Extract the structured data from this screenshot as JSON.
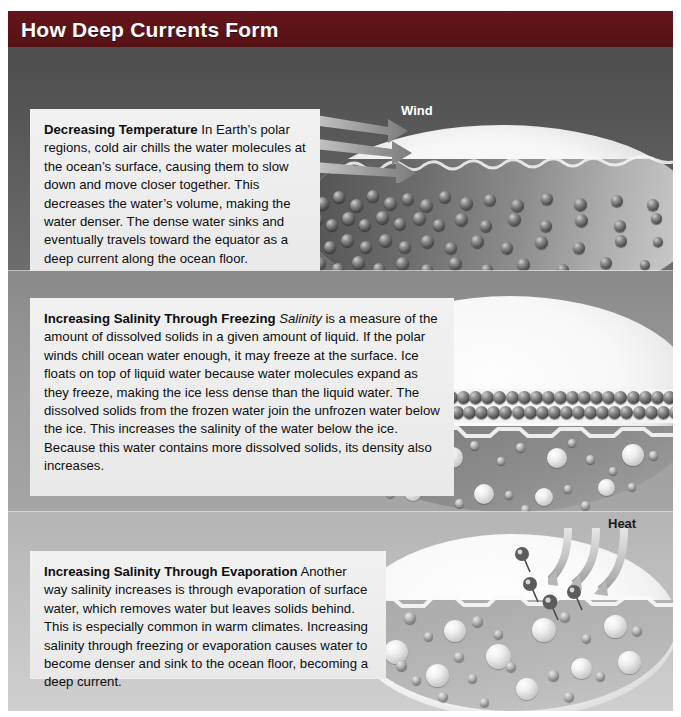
{
  "figure": {
    "title": "How Deep Currents Form",
    "title_bar_color": "#5d1418",
    "frame_background": "#b9b9b9"
  },
  "panels": [
    {
      "id": "panel-1",
      "background_color": "#5a5a5a",
      "art_label": "Wind",
      "art_label_style": "light",
      "callout": {
        "lead": "Decreasing Temperature",
        "body": " In Earth’s polar regions, cold air chills the water molecules at the ocean’s surface, causing them to slow down and move closer together. This decreases the water’s volume, making the water denser. The dense water sinks and eventually travels toward the equator as a deep current along the ocean floor."
      }
    },
    {
      "id": "panel-2",
      "background_color": "#9a9a9a",
      "art_label": "",
      "art_label_style": "light",
      "callout": {
        "lead": "Increasing Salinity Through Freezing",
        "italic_term": "Salinity",
        "body_before_italic": "  ",
        "body": " is a measure of the amount of dissolved solids in a given amount of liquid. If the polar winds chill ocean water enough, it may freeze at the surface. Ice floats on top of liquid water because water molecules expand as they freeze, making the ice less dense than the liquid water. The dissolved solids from the frozen water join the unfrozen water below the ice. This increases the salinity of the water below the ice. Because this water contains more dissolved solids, its density also increases."
      }
    },
    {
      "id": "panel-3",
      "background_color": "#c2c2c2",
      "art_label": "Heat",
      "art_label_style": "dark",
      "callout": {
        "lead": "Increasing Salinity Through Evaporation",
        "body": " Another way salinity increases is through evaporation of surface water, which removes water but leaves solids behind. This is especially common in warm climates. Increasing salinity through freezing or evaporation causes water to become denser and sink to the ocean floor, becoming a deep current."
      }
    }
  ],
  "icons": {
    "wind_arrows": "wind-arrow-icon",
    "heat_arrows": "heat-arrow-icon",
    "water_molecule": "water-molecule-icon",
    "dissolved_solid": "dissolved-solid-icon",
    "ice_crystal": "ice-crystal-icon"
  }
}
